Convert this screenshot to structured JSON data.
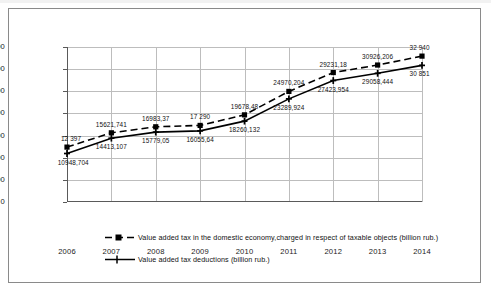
{
  "chart_data": {
    "type": "line",
    "title": "",
    "xlabel": "",
    "ylabel": "",
    "categories": [
      "2006",
      "2007",
      "2008",
      "2009",
      "2010",
      "2011",
      "2012",
      "2013",
      "2014"
    ],
    "ylim": [
      0,
      35000
    ],
    "yticks": [
      0,
      5000,
      10000,
      15000,
      20000,
      25000,
      30000,
      35000
    ],
    "ytick_labels": [
      "0",
      "5 000",
      "10 000",
      "15 000",
      "20 000",
      "25 000",
      "30 000",
      "35 000"
    ],
    "grid": true,
    "legend_position": "bottom",
    "series": [
      {
        "name": "Value added tax in the domestic economy,charged in respect of taxable objects  (billion rub.)",
        "style": "dashed",
        "marker": "square",
        "values": [
          12397,
          15621.741,
          16983.37,
          17290,
          19678.48,
          24970.204,
          29231.18,
          30926.206,
          32940
        ],
        "labels": [
          "12 397",
          "15621,741",
          "16983,37",
          "17 290",
          "19678,48",
          "24970,204",
          "29231,18",
          "30926,206",
          "32 940"
        ]
      },
      {
        "name": "Value added tax deductions  (billion rub.)",
        "style": "solid",
        "marker": "cross",
        "values": [
          10948.704,
          14413.107,
          15779.05,
          16055.64,
          18260.132,
          23289.924,
          27423.954,
          29058.444,
          30851
        ],
        "labels": [
          "10948,704",
          "14413,107",
          "15779,05",
          "16055,64",
          "18260,132",
          "23289,924",
          "27423,954",
          "29058,444",
          "30 851"
        ]
      }
    ]
  },
  "legend": {
    "items": [
      {
        "label": "Value added tax in the domestic economy,charged in respect of taxable objects  (billion rub.)"
      },
      {
        "label": "Value added tax deductions  (billion rub.)"
      }
    ]
  }
}
